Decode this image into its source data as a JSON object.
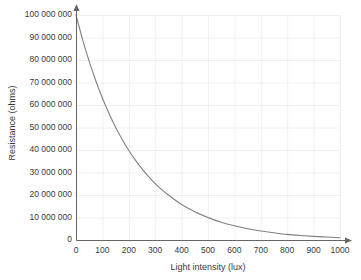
{
  "chart_data": {
    "type": "line",
    "title": "",
    "xlabel": "Light intensity (lux)",
    "ylabel": "Resistance (ohms)",
    "xlim": [
      0,
      1000
    ],
    "ylim": [
      0,
      100000000
    ],
    "grid": true,
    "legend": "none",
    "series": [
      {
        "name": "Resistance",
        "color": "#808080",
        "x": [
          0,
          25,
          50,
          75,
          100,
          125,
          150,
          175,
          200,
          225,
          250,
          275,
          300,
          325,
          350,
          375,
          400,
          425,
          450,
          475,
          500,
          550,
          600,
          650,
          700,
          750,
          800,
          850,
          900,
          950,
          1000
        ],
        "values": [
          100000000,
          89100000,
          79400000,
          70800000,
          63100000,
          56200000,
          50100000,
          44700000,
          39800000,
          35500000,
          31600000,
          28200000,
          25100000,
          22400000,
          20000000,
          17800000,
          15800000,
          14100000,
          12600000,
          11200000,
          10000000,
          7900000,
          6300000,
          5000000,
          4000000,
          3200000,
          2500000,
          2000000,
          1600000,
          1300000,
          1000000
        ]
      }
    ],
    "x_ticks": [
      {
        "value": 0,
        "label": "0"
      },
      {
        "value": 100,
        "label": "100"
      },
      {
        "value": 200,
        "label": "200"
      },
      {
        "value": 300,
        "label": "300"
      },
      {
        "value": 400,
        "label": "400"
      },
      {
        "value": 500,
        "label": "500"
      },
      {
        "value": 600,
        "label": "600"
      },
      {
        "value": 700,
        "label": "700"
      },
      {
        "value": 800,
        "label": "800"
      },
      {
        "value": 900,
        "label": "900"
      },
      {
        "value": 1000,
        "label": "1000"
      }
    ],
    "y_ticks": [
      {
        "value": 0,
        "label": "0"
      },
      {
        "value": 10000000,
        "label": "10 000 000"
      },
      {
        "value": 20000000,
        "label": "20 000 000"
      },
      {
        "value": 30000000,
        "label": "30 000 000"
      },
      {
        "value": 40000000,
        "label": "40 000 000"
      },
      {
        "value": 50000000,
        "label": "50 000 000"
      },
      {
        "value": 60000000,
        "label": "60 000 000"
      },
      {
        "value": 70000000,
        "label": "70 000 000"
      },
      {
        "value": 80000000,
        "label": "80 000 000"
      },
      {
        "value": 90000000,
        "label": "90 000 000"
      },
      {
        "value": 100000000,
        "label": "100 000 000"
      }
    ],
    "colors": {
      "curve": "#808080",
      "axis": "#666666",
      "grid": "#f0f0f0",
      "text": "#3a3a3a",
      "background": "#ffffff"
    }
  }
}
